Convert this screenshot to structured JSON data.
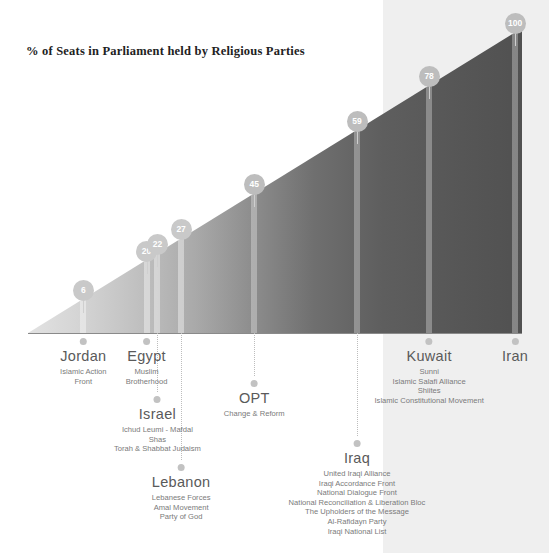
{
  "chart_data": {
    "type": "bar",
    "title": "% of Seats in Parliament held by Religious Parties",
    "xlabel": "",
    "ylabel": "% of Seats",
    "ylim": [
      0,
      100
    ],
    "categories": [
      "Jordan",
      "Egypt",
      "Israel",
      "Lebanon",
      "OPT",
      "Iraq",
      "Kuwait",
      "Iran"
    ],
    "values": [
      6,
      20,
      22,
      27,
      45,
      59,
      78,
      100
    ],
    "grid": false,
    "legend": "none",
    "annotations": [
      "Bars rendered as vertical marker bands on an ascending gradient triangle",
      "Values shown in circular bubbles at the top of each band"
    ]
  },
  "header": {
    "title": "% of Seats in Parliament held by Religious Parties"
  },
  "countries": [
    {
      "name": "Jordan",
      "value": "6",
      "parties": [
        "Islamic Action",
        "Front"
      ],
      "x_pct": 11.2,
      "label_top": 338,
      "leader_height": 0
    },
    {
      "name": "Egypt",
      "value": "20",
      "parties": [
        "Muslim",
        "Brotherhood"
      ],
      "x_pct": 24.0,
      "label_top": 338,
      "leader_height": 0
    },
    {
      "name": "Israel",
      "value": "22",
      "parties": [
        "Ichud Leumi - Mafdal",
        "Shas",
        "Torah & Shabbat Judaism"
      ],
      "x_pct": 26.2,
      "label_top": 396,
      "leader_height": 58
    },
    {
      "name": "Lebanon",
      "value": "27",
      "parties": [
        "Lebanese Forces",
        "Amal Movement",
        "Party of God"
      ],
      "x_pct": 31.0,
      "label_top": 464,
      "leader_height": 126
    },
    {
      "name": "OPT",
      "value": "45",
      "parties": [
        "Change & Reform"
      ],
      "x_pct": 45.8,
      "label_top": 380,
      "leader_height": 42
    },
    {
      "name": "Iraq",
      "value": "59",
      "parties": [
        "United Iraqi Alliance",
        "Iraqi Accordance Front",
        "National Dialogue Front",
        "National Reconciliation & Liberation Bloc",
        "The Upholders of the Message",
        "Al-Rafidayn Party",
        "Iraqi National List"
      ],
      "x_pct": 66.6,
      "label_top": 440,
      "leader_height": 102
    },
    {
      "name": "Kuwait",
      "value": "78",
      "parties": [
        "Sunni",
        "Islamic Salafi Alliance",
        "Shiites",
        "Islamic Constitutional Movement"
      ],
      "x_pct": 81.2,
      "label_top": 338,
      "leader_height": 0
    },
    {
      "name": "Iran",
      "value": "100",
      "parties": [],
      "x_pct": 98.6,
      "label_top": 338,
      "leader_height": 0
    }
  ],
  "colors": {
    "panel": "#efefef",
    "bubble": "#bdbdbd",
    "axis": "#8a8a8a",
    "ramp_light": "#e2e2e2",
    "ramp_dark": "#515151",
    "text": "#6b6b6b"
  }
}
